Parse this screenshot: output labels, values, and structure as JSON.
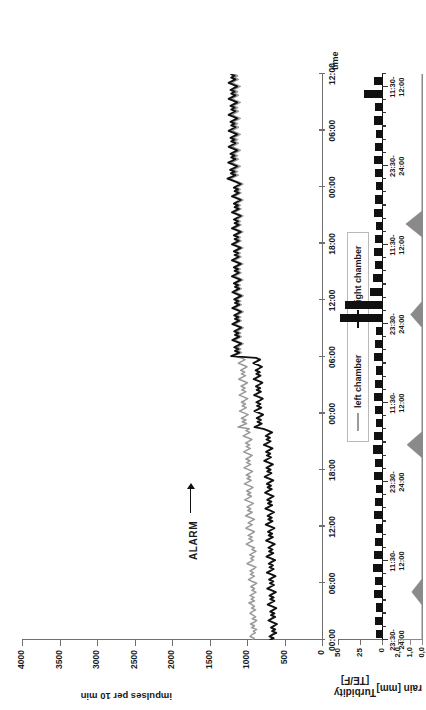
{
  "figure": {
    "alarm_annotation": "ALARM",
    "panels": [
      "main",
      "turbidity",
      "rain"
    ]
  },
  "legend": {
    "items": [
      {
        "label": "left chamber",
        "color": "#9a9a9a"
      },
      {
        "label": "right chamber",
        "color": "#111111"
      }
    ]
  },
  "chart_data": [
    {
      "type": "line",
      "name": "main",
      "title": "",
      "xlabel": "time",
      "ylabel": "impulses per 10 min",
      "ylim": [
        0,
        4000
      ],
      "yticks": [
        0,
        500,
        1000,
        1500,
        2000,
        2500,
        3000,
        3500,
        4000
      ],
      "ytick_labels": [
        "0",
        "500",
        "1000",
        "1500",
        "2000",
        "2500",
        "3000",
        "3500",
        "4000"
      ],
      "xtick_labels": [
        "00:00",
        "06:00",
        "12:00",
        "18:00",
        "00:00",
        "06:00",
        "12:00",
        "18:00",
        "00:00",
        "06:00",
        "12:00"
      ],
      "grid": false,
      "legend_position": "bottom-center",
      "annotations": [
        {
          "text": "ALARM",
          "x_frac": 0.175,
          "y_value": 1150
        }
      ],
      "series": [
        {
          "name": "left chamber",
          "color": "#9a9a9a",
          "values": [
            930,
            905,
            960,
            935,
            890,
            915,
            870,
            940,
            900,
            955,
            905,
            870,
            930,
            885,
            920,
            960,
            930,
            885,
            940,
            900,
            935,
            975,
            900,
            945,
            905,
            960,
            920,
            880,
            935,
            900,
            950,
            910,
            870,
            930,
            980,
            940,
            900,
            955,
            915,
            960,
            915,
            880,
            935,
            1000,
            960,
            915,
            950,
            905,
            965,
            925,
            880,
            935,
            900,
            960,
            1010,
            965,
            920,
            975,
            930,
            985,
            940,
            900,
            955,
            1015,
            975,
            930,
            985,
            945,
            900,
            960,
            1020,
            975,
            930,
            990,
            950,
            1000,
            955,
            915,
            970,
            1030,
            985,
            940,
            995,
            950,
            1005,
            960,
            920,
            975,
            1035,
            990,
            945,
            1000,
            955,
            1010,
            965,
            925,
            980,
            1040,
            995,
            950,
            1005,
            960,
            1015,
            970,
            930,
            985,
            1045,
            1000,
            955,
            1010,
            965,
            1020,
            975,
            935,
            990,
            1050,
            1005,
            960,
            1015,
            970,
            1120,
            1060,
            1005,
            1065,
            1015,
            1075,
            1025,
            985,
            1040,
            1100,
            1055,
            1010,
            1065,
            1020,
            1075,
            1030,
            990,
            1045,
            1105,
            1060,
            1015,
            1070,
            1025,
            1080,
            1035,
            995,
            1050,
            1110,
            1065,
            1020,
            1075,
            1030,
            1085,
            1040,
            1000,
            1055,
            1115,
            1070,
            1025,
            1080,
            1180,
            1125,
            1075,
            1130,
            1085,
            1140,
            1095,
            1050,
            1105,
            1165,
            1120,
            1075,
            1130,
            1085,
            1140,
            1095,
            1050,
            1105,
            1165,
            1120,
            1075,
            1130,
            1085,
            1140,
            1095,
            1050,
            1105,
            1165,
            1120,
            1075,
            1130,
            1085,
            1140,
            1095,
            1050,
            1105,
            1165,
            1120,
            1075,
            1130,
            1090,
            1145,
            1100,
            1055,
            1110,
            1170,
            1125,
            1080,
            1135,
            1090,
            1145,
            1100,
            1055,
            1110,
            1170,
            1125,
            1080,
            1135,
            1090,
            1145,
            1100,
            1055,
            1110,
            1170,
            1125,
            1080,
            1135,
            1090,
            1145,
            1100,
            1055,
            1110,
            1170,
            1125,
            1080,
            1135,
            1090,
            1145,
            1100,
            1055,
            1110,
            1170,
            1125,
            1080,
            1135,
            1090,
            1145,
            1100,
            1055,
            1110,
            1170,
            1125,
            1080,
            1135,
            1090,
            1145,
            1100,
            1055,
            1110,
            1170,
            1220,
            1165,
            1115,
            1175,
            1125,
            1185,
            1135,
            1090,
            1150,
            1210,
            1160,
            1115,
            1170,
            1125,
            1180,
            1135,
            1090,
            1145,
            1205,
            1160,
            1115,
            1170,
            1125,
            1180,
            1135,
            1090,
            1145,
            1205,
            1160,
            1115,
            1170,
            1125,
            1180,
            1135,
            1090,
            1145,
            1205,
            1160,
            1115,
            1170,
            1125,
            1180,
            1135,
            1090,
            1145,
            1205,
            1160,
            1115,
            1170,
            1125,
            1180,
            1135,
            1090,
            1145,
            1205,
            1160,
            1115,
            1170,
            1125,
            1180
          ]
        },
        {
          "name": "right chamber",
          "color": "#111111",
          "values": [
            700,
            645,
            700,
            660,
            610,
            665,
            625,
            680,
            640,
            600,
            655,
            715,
            670,
            625,
            680,
            635,
            690,
            650,
            610,
            665,
            725,
            680,
            635,
            690,
            645,
            700,
            660,
            615,
            670,
            730,
            685,
            640,
            695,
            650,
            705,
            665,
            620,
            675,
            735,
            690,
            645,
            700,
            655,
            710,
            670,
            625,
            680,
            740,
            695,
            650,
            705,
            660,
            715,
            675,
            630,
            685,
            745,
            700,
            655,
            710,
            665,
            720,
            680,
            635,
            690,
            750,
            705,
            660,
            715,
            670,
            725,
            685,
            640,
            695,
            755,
            710,
            665,
            720,
            675,
            730,
            690,
            645,
            700,
            760,
            715,
            670,
            725,
            680,
            735,
            695,
            650,
            705,
            765,
            720,
            675,
            730,
            685,
            740,
            700,
            655,
            710,
            770,
            725,
            680,
            735,
            690,
            745,
            705,
            660,
            715,
            775,
            730,
            685,
            740,
            695,
            750,
            710,
            665,
            720,
            780,
            900,
            850,
            805,
            860,
            815,
            870,
            825,
            785,
            840,
            900,
            855,
            810,
            865,
            820,
            875,
            830,
            790,
            845,
            905,
            860,
            815,
            870,
            825,
            880,
            835,
            795,
            850,
            910,
            865,
            820,
            875,
            830,
            885,
            840,
            800,
            855,
            915,
            870,
            825,
            880,
            1210,
            1155,
            1105,
            1160,
            1115,
            1170,
            1125,
            1080,
            1135,
            1195,
            1150,
            1105,
            1160,
            1115,
            1170,
            1125,
            1080,
            1135,
            1195,
            1150,
            1105,
            1160,
            1115,
            1170,
            1125,
            1080,
            1135,
            1195,
            1150,
            1105,
            1160,
            1115,
            1170,
            1125,
            1080,
            1135,
            1195,
            1150,
            1105,
            1160,
            1120,
            1175,
            1130,
            1085,
            1140,
            1200,
            1155,
            1110,
            1165,
            1120,
            1175,
            1130,
            1085,
            1140,
            1200,
            1155,
            1110,
            1165,
            1120,
            1175,
            1130,
            1085,
            1140,
            1200,
            1155,
            1110,
            1165,
            1120,
            1175,
            1130,
            1085,
            1140,
            1200,
            1155,
            1110,
            1165,
            1120,
            1175,
            1130,
            1085,
            1140,
            1200,
            1155,
            1110,
            1165,
            1120,
            1175,
            1130,
            1085,
            1140,
            1200,
            1155,
            1110,
            1165,
            1120,
            1175,
            1130,
            1085,
            1140,
            1200,
            1260,
            1205,
            1155,
            1215,
            1165,
            1225,
            1175,
            1130,
            1190,
            1250,
            1200,
            1155,
            1210,
            1165,
            1220,
            1175,
            1130,
            1185,
            1245,
            1200,
            1155,
            1210,
            1165,
            1220,
            1175,
            1130,
            1185,
            1245,
            1200,
            1155,
            1210,
            1165,
            1220,
            1175,
            1130,
            1185,
            1245,
            1200,
            1155,
            1210,
            1165,
            1220,
            1175,
            1130,
            1185,
            1245,
            1200,
            1155,
            1210,
            1165,
            1220,
            1175,
            1130,
            1185,
            1245,
            1200,
            1155,
            1210,
            1165,
            1220
          ]
        }
      ]
    },
    {
      "type": "bar",
      "name": "turbidity",
      "ylabel": "Turbidity\n[TE/F]",
      "ylabel_line1": "Turbidity",
      "ylabel_line2": "[TE/F]",
      "ylim": [
        0,
        50
      ],
      "yticks": [
        0,
        25,
        50
      ],
      "ytick_labels": [
        "0",
        "25",
        "50"
      ],
      "xtick_labels": [
        {
          "line1": "23:30-",
          "line2": "24:00",
          "index": 0
        },
        {
          "line1": "11:30-",
          "line2": "12:00",
          "index": 6
        },
        {
          "line1": "23:30-",
          "line2": "24:00",
          "index": 12
        },
        {
          "line1": "11:30-",
          "line2": "12:00",
          "index": 18
        },
        {
          "line1": "23:30-",
          "line2": "24:00",
          "index": 24
        },
        {
          "line1": "11:30-",
          "line2": "12:00",
          "index": 30
        },
        {
          "line1": "23:30-",
          "line2": "24:00",
          "index": 36
        },
        {
          "line1": "11:30-",
          "line2": "12:00",
          "index": 42
        }
      ],
      "color": "#111111",
      "values": [
        7,
        8,
        7,
        9,
        8,
        10,
        9,
        8,
        7,
        9,
        8,
        7,
        9,
        8,
        10,
        9,
        7,
        8,
        9,
        8,
        7,
        9,
        8,
        7,
        48,
        42,
        14,
        10,
        8,
        9,
        8,
        7,
        9,
        8,
        7,
        8,
        9,
        8,
        7,
        9,
        8,
        21,
        9
      ]
    },
    {
      "type": "area",
      "name": "rain",
      "ylabel": "rain [mm]",
      "ylim": [
        0,
        2.0
      ],
      "yticks": [
        0.0,
        1.0,
        2.0
      ],
      "ytick_labels": [
        "0,0",
        "1,0",
        "2,0"
      ],
      "color": "#8a8a8a",
      "peaks": [
        {
          "x_frac": 0.085,
          "value": 0.85
        },
        {
          "x_frac": 0.345,
          "value": 1.25
        },
        {
          "x_frac": 0.575,
          "value": 0.95
        },
        {
          "x_frac": 0.735,
          "value": 1.35
        }
      ]
    }
  ]
}
